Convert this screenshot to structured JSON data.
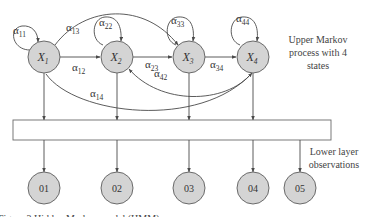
{
  "diagram": {
    "title_note": [
      "Upper Markov",
      "process with 4",
      "states"
    ],
    "lower_note": [
      "Lower layer",
      "observations"
    ],
    "states": [
      {
        "id": "X1",
        "base": "X",
        "sub": "1"
      },
      {
        "id": "X2",
        "base": "X",
        "sub": "2"
      },
      {
        "id": "X3",
        "base": "X",
        "sub": "3"
      },
      {
        "id": "X4",
        "base": "X",
        "sub": "4"
      }
    ],
    "observations": [
      "01",
      "02",
      "03",
      "04",
      "05"
    ],
    "transitions": [
      {
        "base": "α",
        "sub": "11"
      },
      {
        "base": "α",
        "sub": "22"
      },
      {
        "base": "α",
        "sub": "33"
      },
      {
        "base": "α",
        "sub": "44"
      },
      {
        "base": "α",
        "sub": "12"
      },
      {
        "base": "α",
        "sub": "23"
      },
      {
        "base": "α",
        "sub": "34"
      },
      {
        "base": "α",
        "sub": "13"
      },
      {
        "base": "α",
        "sub": "14"
      },
      {
        "base": "α",
        "sub": "42"
      }
    ],
    "caption": "Figure 3  Hidden Markov model (HMM) ..."
  },
  "colors": {
    "node_fill": "#d4d4d4",
    "node_stroke": "#6a6a6a",
    "edge": "#4a4a4a"
  }
}
